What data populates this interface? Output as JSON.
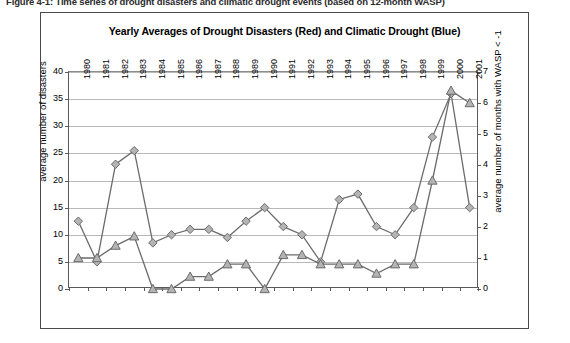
{
  "caption": "Figure 4-1: Time series of drought disasters and climatic drought events (based on 12-month WASP)",
  "chart_data": {
    "type": "line",
    "title": "Yearly Averages of Drought Disasters (Red) and Climatic Drought (Blue)",
    "xlabel": "",
    "ylabel": "average number of disasters",
    "y2label": "average number of months with WASP < -1",
    "categories": [
      "1980",
      "1981",
      "1982",
      "1983",
      "1984",
      "1985",
      "1986",
      "1987",
      "1988",
      "1989",
      "1990",
      "1991",
      "1992",
      "1993",
      "1994",
      "1995",
      "1996",
      "1997",
      "1998",
      "1999",
      "2000",
      "2001"
    ],
    "ylim": [
      0,
      40
    ],
    "yticks": [
      "0",
      "5",
      "10",
      "15",
      "20",
      "25",
      "30",
      "35",
      "40"
    ],
    "y2lim": [
      0,
      7
    ],
    "y2ticks": [
      "0",
      "1",
      "2",
      "3",
      "4",
      "5",
      "6",
      "7"
    ],
    "grid": true,
    "legend": "none",
    "series": [
      {
        "name": "Drought Disasters (Red)",
        "marker": "diamond",
        "axis": "left",
        "color": "#7f7f7f",
        "values": [
          12.5,
          5.0,
          23.0,
          25.5,
          8.5,
          10.0,
          11.0,
          11.0,
          9.5,
          12.5,
          15.0,
          11.5,
          10.0,
          5.0,
          16.5,
          17.5,
          11.5,
          10.0,
          15.0,
          28.0,
          36.0,
          15.0
        ]
      },
      {
        "name": "Climatic Drought (Blue)",
        "marker": "triangle",
        "axis": "right",
        "color": "#7f7f7f",
        "values": [
          1.0,
          1.0,
          1.4,
          1.7,
          0.0,
          0.0,
          0.4,
          0.4,
          0.8,
          0.8,
          0.0,
          1.1,
          1.1,
          0.8,
          0.8,
          0.8,
          0.5,
          0.8,
          0.8,
          3.5,
          6.4,
          6.0
        ]
      }
    ]
  }
}
